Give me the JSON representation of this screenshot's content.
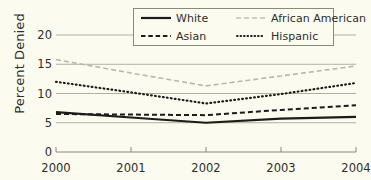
{
  "chart_data": {
    "type": "line",
    "title": "",
    "xlabel": "",
    "ylabel": "Percent Denied",
    "x": [
      2000,
      2001,
      2002,
      2003,
      2004
    ],
    "categories": [
      "2000",
      "2001",
      "2002",
      "2003",
      "2004"
    ],
    "xtick_labels": [
      "2000",
      "2001",
      "2002",
      "2003",
      "2004"
    ],
    "ytick_labels": [
      "0",
      "5",
      "10",
      "15",
      "20"
    ],
    "ytick_values": [
      0,
      5,
      10,
      15,
      20
    ],
    "ylim": [
      0,
      20
    ],
    "xlim": [
      2000,
      2004
    ],
    "grid": "horizontal",
    "legend_position": "top-center",
    "series": [
      {
        "name": "White",
        "values": [
          6.8,
          5.9,
          5.0,
          5.7,
          6.0
        ],
        "style": "solid",
        "color": "#1c1c18"
      },
      {
        "name": "Asian",
        "values": [
          6.5,
          6.4,
          6.3,
          7.2,
          8.0
        ],
        "style": "dashed",
        "color": "#1c1c18"
      },
      {
        "name": "African American",
        "values": [
          15.8,
          13.5,
          11.3,
          13.0,
          14.7
        ],
        "style": "dashed",
        "color": "#b9b9a8"
      },
      {
        "name": "Hispanic",
        "values": [
          12.0,
          10.2,
          8.3,
          9.9,
          11.8
        ],
        "style": "dotted",
        "color": "#1c1c18"
      }
    ]
  },
  "legend": {
    "entries": [
      {
        "label": "White",
        "icon": "solid-line-icon"
      },
      {
        "label": "African American",
        "icon": "dashed-gray-line-icon"
      },
      {
        "label": "Asian",
        "icon": "dashed-line-icon"
      },
      {
        "label": "Hispanic",
        "icon": "dotted-line-icon"
      }
    ]
  },
  "colors": {
    "background": "#fbfbf0",
    "gridline": "#b0b0a0",
    "axis": "#8a8a78",
    "text": "#2e2e28",
    "series_dark": "#1c1c18",
    "series_light": "#b9b9a8"
  }
}
